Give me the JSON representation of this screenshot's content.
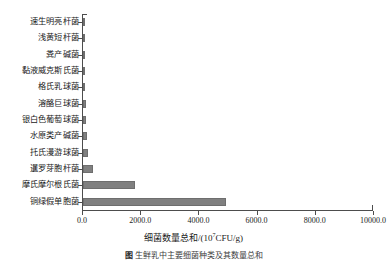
{
  "chart_data": {
    "type": "bar",
    "orientation": "horizontal",
    "title": "",
    "xlabel": "细菌数量总和/(10⁷CFU/g)",
    "xlabel_base": "细菌数量总和/(10",
    "xlabel_sup": "7",
    "xlabel_tail": "CFU/g)",
    "ylabel": "",
    "categories": [
      "速生明亮杆菌",
      "浅黄短杆菌",
      "粪产碱菌",
      "黏液威克斯氏菌",
      "格氏乳球菌",
      "溶酪巨球菌",
      "银白色葡萄球菌",
      "水原类产碱菌",
      "托氏漫游球菌",
      "暹罗芽胞杆菌",
      "摩氏摩尔根氏菌",
      "铜绿假单胞菌"
    ],
    "values": [
      20,
      25,
      30,
      40,
      60,
      110,
      120,
      130,
      170,
      330,
      1800,
      4900
    ],
    "xlim": [
      0,
      10000
    ],
    "xticks": [
      0,
      2000,
      4000,
      6000,
      8000,
      10000
    ],
    "xticklabels": [
      "0.0",
      "2000.0",
      "4000.0",
      "6000.0",
      "8000.0",
      "10000.0"
    ],
    "grid": false,
    "legend": false,
    "bar_color": "#808080",
    "axis_color": "#4d4d4d"
  },
  "caption": {
    "tag": "图",
    "text": "生鲜乳中主要细菌种类及其数量总和"
  }
}
